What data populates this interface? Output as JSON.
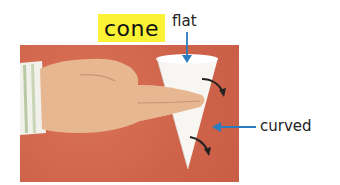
{
  "title": "cone",
  "labels": {
    "flat": "flat",
    "curved": "curved"
  },
  "colors": {
    "title_highlight": "#fbf236",
    "photo_background": "#d3694f",
    "arrow_blue": "#2b7bbf"
  },
  "image": {
    "description": "hand holding a white paper cone on a red background",
    "icons": [
      "hand",
      "cone",
      "curved-arrow",
      "curved-arrow"
    ]
  }
}
